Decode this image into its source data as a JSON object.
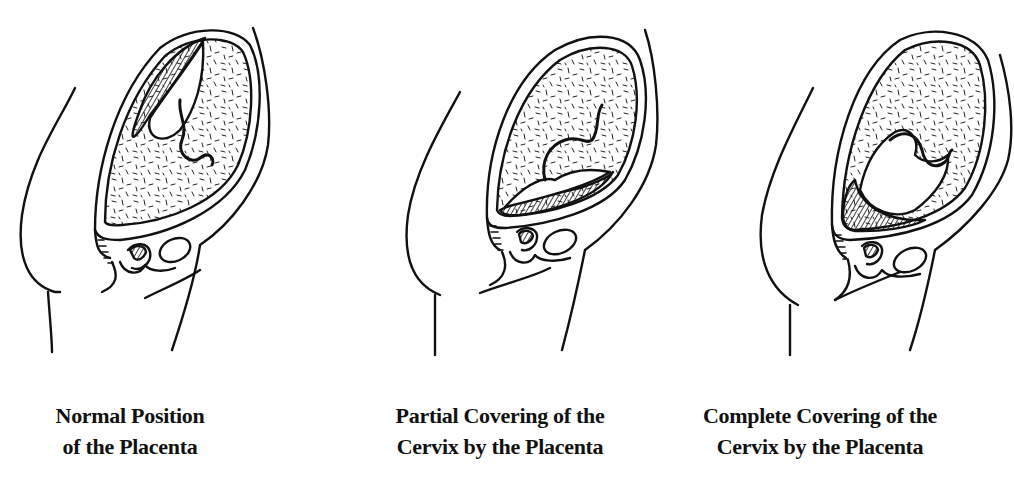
{
  "diagram": {
    "style": "black-and-white line illustration",
    "colors": {
      "ink": "#111111",
      "background": "#ffffff"
    },
    "panels": [
      {
        "id": "normal",
        "caption_line1": "Normal Position",
        "caption_line2": "of the Placenta"
      },
      {
        "id": "partial",
        "caption_line1": "Partial Covering of the",
        "caption_line2": "Cervix by the Placenta"
      },
      {
        "id": "complete",
        "caption_line1": "Complete Covering of the",
        "caption_line2": "Cervix by the Placenta"
      }
    ]
  }
}
